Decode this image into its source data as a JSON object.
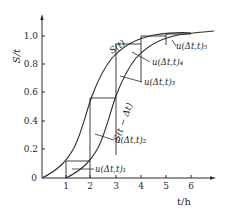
{
  "figure": {
    "y_axis_label": "S/t",
    "x_axis_label": "t/h",
    "y_ticks": [
      "0",
      "0.2",
      "0.4",
      "0.6",
      "0.8",
      "1.0"
    ],
    "x_ticks": [
      "1",
      "2",
      "3",
      "4",
      "5",
      "6"
    ],
    "curves": {
      "s_curve": "S(t)",
      "shifted_curve": "S(t − Δt)"
    },
    "annotations": [
      "u(Δt,t)₁",
      "u(Δt,t)₂",
      "u(Δt,t)₃",
      "u(Δt,t)₄",
      "u(Δt,t)₅"
    ],
    "colors": {
      "line": "#2a2a2a",
      "background": "#ffffff"
    }
  }
}
